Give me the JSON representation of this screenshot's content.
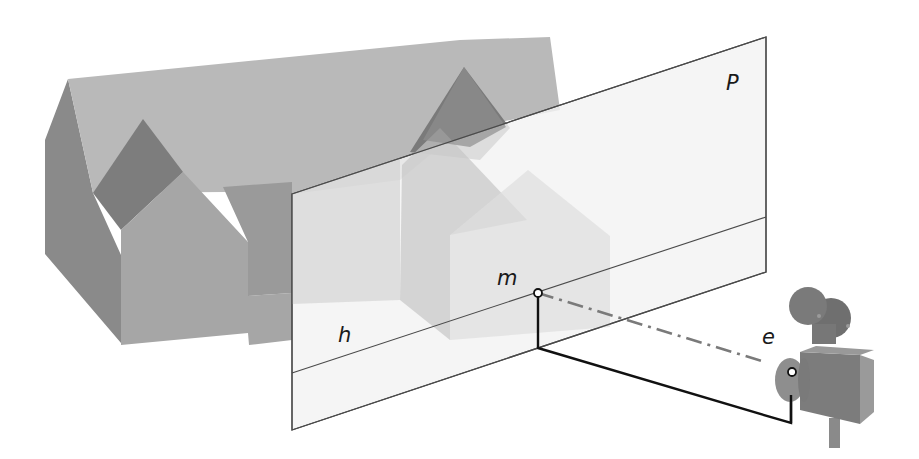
{
  "figure": {
    "labels": {
      "plane": "P",
      "point": "m",
      "horizon": "h",
      "eye": "e"
    },
    "colors": {
      "background": "#ffffff",
      "roof_light": "#b9b9b9",
      "wall_dark": "#8a8a8a",
      "wall_mid": "#a6a6a6",
      "plane_fill": "#f4f4f4",
      "plane_edge": "#4a4a4a",
      "sight_line": "#7a7a7a",
      "ground_line": "#111111",
      "camera": "#7f7f7f"
    }
  }
}
